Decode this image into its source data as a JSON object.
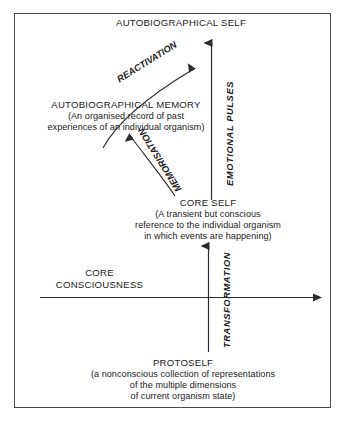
{
  "diagram": {
    "title_top": "AUTOBIOGRAPHICAL SELF",
    "nodes": {
      "autobiographical_self": {
        "heading": "AUTOBIOGRAPHICAL SELF",
        "detail": ""
      },
      "autobiographical_memory": {
        "heading": "AUTOBIOGRAPHICAL MEMORY",
        "detail_line1": "(An organised record of past",
        "detail_line2": "experiences of an individual organism)"
      },
      "core_self": {
        "heading": "CORE SELF",
        "detail_line1": "(A transient but conscious",
        "detail_line2": "reference to the individual organism",
        "detail_line3": "in which events are happening)"
      },
      "core_consciousness": {
        "heading_line1": "CORE",
        "heading_line2": "CONSCIOUSNESS"
      },
      "protoself": {
        "heading": "PROTOSELF",
        "detail_line1": "(a nonconscious collection of representations",
        "detail_line2": "of the multiple dimensions",
        "detail_line3": "of current organism state)"
      }
    },
    "arrows": {
      "reactivation": "REACTIVATION",
      "memorisation": "MEMORISATION",
      "emotional_pulses": "EMOTIONAL PULSES",
      "transformation": "TRANSFORMATION"
    },
    "colors": {
      "ink": "#1a1a1a",
      "frame": "#4a4a4a",
      "background": "#ffffff"
    }
  }
}
